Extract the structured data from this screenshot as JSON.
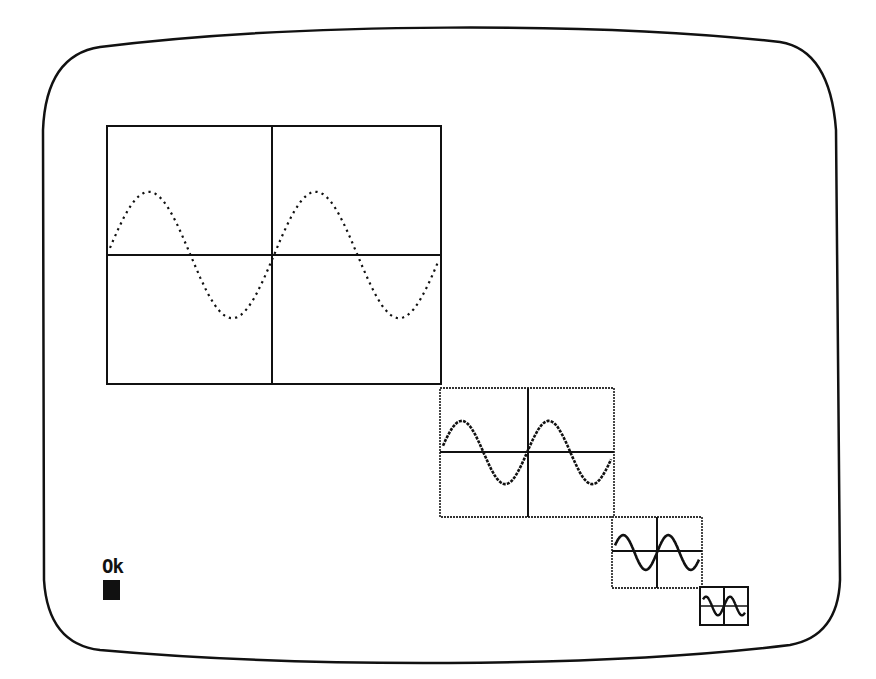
{
  "screen": {
    "type": "crt-monitor",
    "background": "#ffffff",
    "ink": "#111111"
  },
  "console": {
    "prompt_text": "Ok",
    "cursor": "block-cursor"
  },
  "plots": [
    {
      "id": "plot-1",
      "label": "large sine plot",
      "x": 107,
      "y": 126,
      "w": 334,
      "h": 258,
      "cycles": 2,
      "style": "dotted"
    },
    {
      "id": "plot-2",
      "label": "medium sine plot",
      "x": 440,
      "y": 388,
      "w": 174,
      "h": 129,
      "cycles": 2,
      "style": "dotted-dense"
    },
    {
      "id": "plot-3",
      "label": "small sine plot",
      "x": 612,
      "y": 517,
      "w": 90,
      "h": 71,
      "cycles": 2,
      "style": "solid"
    },
    {
      "id": "plot-4",
      "label": "tiny sine plot",
      "x": 700,
      "y": 587,
      "w": 48,
      "h": 38,
      "cycles": 2,
      "style": "solid"
    }
  ]
}
